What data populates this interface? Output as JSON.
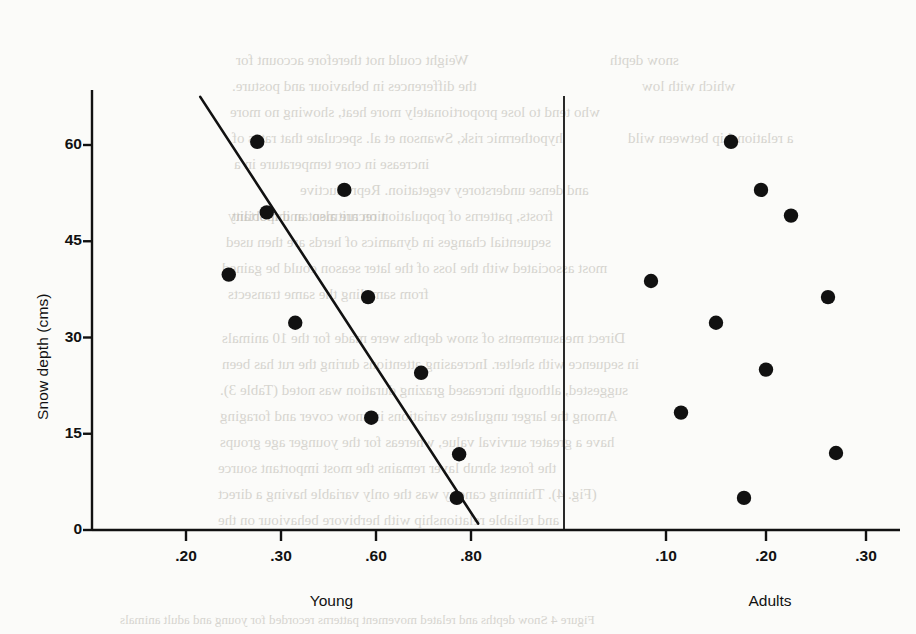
{
  "figure": {
    "background_color": "#fbfbf9",
    "ink_color": "#111111"
  },
  "chart_data": {
    "type": "scatter",
    "title": "",
    "subtitle": "",
    "ylabel": "Snow depth (cms)",
    "xlabel": "",
    "ylim": [
      0,
      68
    ],
    "yticks": [
      0,
      15,
      30,
      45,
      60
    ],
    "ytick_labels": [
      "0",
      "15",
      "30",
      "45",
      "60"
    ],
    "grid": false,
    "legend": null,
    "annotations": [],
    "panels": [
      {
        "name": "Young",
        "label": "Young",
        "xtick_labels": [
          ".20",
          ".30",
          ".60",
          ".80"
        ],
        "xticks": [
          0.2,
          0.3,
          0.6,
          0.8
        ],
        "points": [
          {
            "x": 0.275,
            "y": 60.5
          },
          {
            "x": 0.5,
            "y": 53.0
          },
          {
            "x": 0.285,
            "y": 49.5
          },
          {
            "x": 0.245,
            "y": 39.8
          },
          {
            "x": 0.575,
            "y": 36.3
          },
          {
            "x": 0.345,
            "y": 32.3
          },
          {
            "x": 0.695,
            "y": 24.5
          },
          {
            "x": 0.585,
            "y": 17.5
          },
          {
            "x": 0.775,
            "y": 11.8
          },
          {
            "x": 0.77,
            "y": 5.0
          }
        ],
        "fit_line": {
          "label": "regression line",
          "x_start": 0.215,
          "y_start": 67.5,
          "x_end": 0.815,
          "y_end": 1.0
        }
      },
      {
        "name": "Adults",
        "label": "Adults",
        "xtick_labels": [
          ".10",
          ".20",
          ".30"
        ],
        "xticks": [
          0.1,
          0.2,
          0.3
        ],
        "points": [
          {
            "x": 0.165,
            "y": 60.5
          },
          {
            "x": 0.195,
            "y": 53.0
          },
          {
            "x": 0.225,
            "y": 49.0
          },
          {
            "x": 0.085,
            "y": 38.8
          },
          {
            "x": 0.262,
            "y": 36.3
          },
          {
            "x": 0.15,
            "y": 32.3
          },
          {
            "x": 0.2,
            "y": 25.0
          },
          {
            "x": 0.115,
            "y": 18.3
          },
          {
            "x": 0.27,
            "y": 12.0
          },
          {
            "x": 0.178,
            "y": 5.0
          }
        ],
        "fit_line": null
      }
    ]
  },
  "bleed_text": {
    "lines": [
      {
        "text": "Weight could not therefore account for",
        "x": 236,
        "y": 52
      },
      {
        "text": "snow depth",
        "x": 610,
        "y": 52
      },
      {
        "text": "the differences in behaviour and posture.",
        "x": 232,
        "y": 78
      },
      {
        "text": "which with low",
        "x": 642,
        "y": 78
      },
      {
        "text": "who tend to lose proportionately more heat, showing no more",
        "x": 230,
        "y": 104
      },
      {
        "text": "hypothermic risk, Swanson et al. speculate that rates of",
        "x": 232,
        "y": 130
      },
      {
        "text": "a relationship between wild",
        "x": 628,
        "y": 130
      },
      {
        "text": "increase in core temperature in a",
        "x": 234,
        "y": 156
      },
      {
        "text": "and dense understorey vegetation. Reproductive",
        "x": 300,
        "y": 182
      },
      {
        "text": "tion are also an important",
        "x": 232,
        "y": 208
      },
      {
        "text": "frosts, patterns of population recruitment and mobility",
        "x": 228,
        "y": 208
      },
      {
        "text": "sequential changes in dynamics of herds are then used",
        "x": 226,
        "y": 234
      },
      {
        "text": "most associated with the loss of the later season could be gained",
        "x": 222,
        "y": 260
      },
      {
        "text": "from sampling the same transects",
        "x": 228,
        "y": 286
      },
      {
        "text": "Direct measurements of snow depths were made for the 10 animals",
        "x": 222,
        "y": 330
      },
      {
        "text": "in sequence with shelter. Increasing attentions during the rut has been",
        "x": 222,
        "y": 356
      },
      {
        "text": "suggested, although increased grazing duration was noted (Table 3).",
        "x": 220,
        "y": 382
      },
      {
        "text": "Among the larger ungulates variations in snow cover and foraging",
        "x": 220,
        "y": 408
      },
      {
        "text": "have a greater survival value, whereas for the younger age groups",
        "x": 220,
        "y": 434
      },
      {
        "text": "the forest shrub layer remains the most important source",
        "x": 218,
        "y": 460
      },
      {
        "text": "(Fig. 4). Thinning canopy was the only variable having a direct",
        "x": 218,
        "y": 486
      },
      {
        "text": "and reliable relationship with herbivore behaviour on the",
        "x": 218,
        "y": 512
      },
      {
        "text": "Figure 4  Snow depths and related movement patterns recorded for young and adult animals",
        "x": 120,
        "y": 612
      }
    ]
  }
}
